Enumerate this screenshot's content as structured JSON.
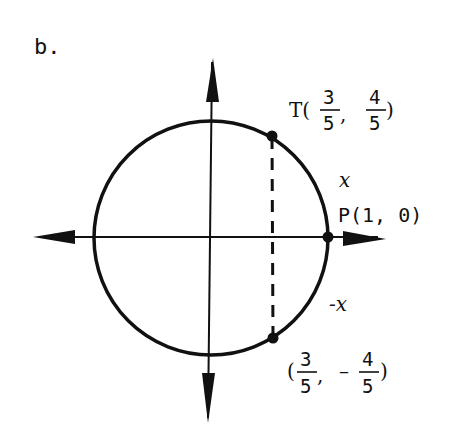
{
  "figure": {
    "label": "b.",
    "points": {
      "T": {
        "name": "T",
        "x_num": "3",
        "x_den": "5",
        "y_sign": "",
        "y_num": "4",
        "y_den": "5",
        "open": "T(",
        "comma": ",",
        "close": ")"
      },
      "P": {
        "text": "P(1, 0)"
      },
      "Q": {
        "x_num": "3",
        "x_den": "5",
        "y_sign": "–",
        "y_num": "4",
        "y_den": "5",
        "open": "(",
        "comma": ",",
        "close": ")"
      }
    },
    "arc_labels": {
      "upper": "x",
      "lower": "-x"
    },
    "colors": {
      "ink": "#111111",
      "background": "#ffffff"
    }
  }
}
